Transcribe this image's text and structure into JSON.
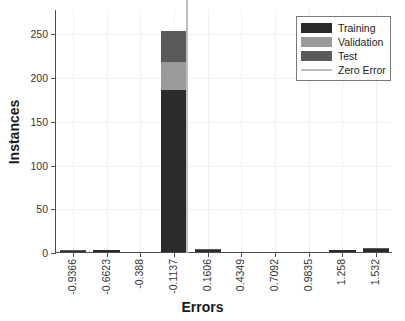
{
  "chart_data": {
    "type": "bar",
    "subtype": "stacked-histogram",
    "title": "",
    "xlabel": "Errors",
    "ylabel": "Instances",
    "categories": [
      "-0.9366",
      "-0.6623",
      "-0.388",
      "-0.1137",
      "0.1606",
      "0.4349",
      "0.7092",
      "0.9835",
      "1.258",
      "1.532"
    ],
    "series": [
      {
        "name": "Training",
        "color": "#2b2b2b",
        "values": [
          1,
          1,
          0,
          185,
          2,
          0,
          0,
          0,
          1,
          3
        ]
      },
      {
        "name": "Validation",
        "color": "#9a9a9a",
        "values": [
          0,
          0,
          0,
          32,
          0,
          0,
          0,
          0,
          0,
          0
        ]
      },
      {
        "name": "Test",
        "color": "#5a5a5a",
        "values": [
          1,
          0,
          0,
          36,
          1,
          0,
          0,
          0,
          0,
          1
        ]
      }
    ],
    "totals": [
      2,
      1,
      0,
      253,
      3,
      0,
      0,
      0,
      1,
      4
    ],
    "yticks": [
      0,
      50,
      100,
      150,
      200,
      250
    ],
    "ylim": [
      0,
      278
    ],
    "xlim_index": [
      -0.5,
      9.5
    ],
    "grid": true,
    "legend_position": "top-right",
    "annotations": [
      {
        "name": "Zero Error",
        "type": "vline",
        "at_category_edge": 3,
        "color": "#bdbdbd"
      }
    ]
  },
  "legend": {
    "entries": [
      {
        "label": "Training",
        "color": "#2b2b2b",
        "marker": "patch"
      },
      {
        "label": "Validation",
        "color": "#9a9a9a",
        "marker": "patch"
      },
      {
        "label": "Test",
        "color": "#5a5a5a",
        "marker": "patch"
      },
      {
        "label": "Zero Error",
        "color": "#bdbdbd",
        "marker": "line"
      }
    ]
  },
  "axes": {
    "x_title": "Errors",
    "y_title": "Instances",
    "y_tick_labels": [
      "0",
      "50",
      "100",
      "150",
      "200",
      "250"
    ],
    "x_tick_labels": [
      "-0.9366",
      "-0.6623",
      "-0.388",
      "-0.1137",
      "0.1606",
      "0.4349",
      "0.7092",
      "0.9835",
      "1.258",
      "1.532"
    ]
  },
  "style": {
    "axis_color": "#4d4d4d",
    "grid_color": "#f0f0f0",
    "background": "#ffffff",
    "text_color": "#343434"
  }
}
